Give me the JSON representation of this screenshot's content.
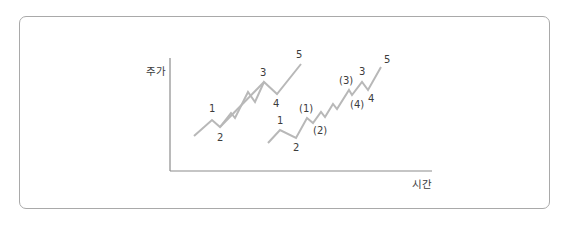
{
  "diagram": {
    "title": "",
    "y_axis_label": "주가",
    "x_axis_label": "시간",
    "colors": {
      "line": "#b8b8b8",
      "axis": "#8c8c8c",
      "text": "#3c3c3c",
      "border": "#a9a9a9"
    },
    "wave_left": {
      "labels": [
        "1",
        "2",
        "3",
        "4",
        "5"
      ]
    },
    "wave_right": {
      "labels": [
        "1",
        "2",
        "(1)",
        "(2)",
        "(3)",
        "3",
        "(4)",
        "4",
        "5"
      ]
    }
  }
}
